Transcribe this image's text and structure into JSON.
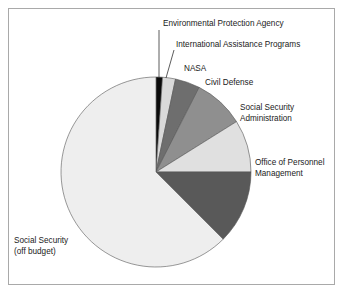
{
  "figure": {
    "background_color": "#ffffff",
    "border_color": "#a9a9a9"
  },
  "chart_data": {
    "type": "pie",
    "title": "",
    "subtitle": "",
    "xlabel": "",
    "ylabel": "",
    "legend_position": "callout-labels",
    "grid": false,
    "start_angle_deg": 90,
    "direction": "clockwise",
    "categories": [
      "Environmental Protection Agency",
      "International Assistance Programs",
      "NASA",
      "Civil Defense",
      "Social Security Administration",
      "Office of Personnel Management",
      "Social Security (off budget)"
    ],
    "values": [
      1.1,
      2.2,
      4.2,
      8.6,
      8.9,
      12.5,
      62.5
    ],
    "units": "percent",
    "colors": [
      "#0a0a0a",
      "#d9d9d9",
      "#6e6e6e",
      "#8f8f8f",
      "#e0e0e0",
      "#595959",
      "#eeeeee"
    ],
    "slice_angles_deg": [
      4,
      8,
      15,
      31,
      32,
      45,
      225
    ]
  },
  "labels": {
    "epa": "Environmental Protection Agency",
    "iap": "International Assistance Programs",
    "nasa": "NASA",
    "civil_defense": "Civil Defense",
    "ssa_line1": "Social Security",
    "ssa_line2": "Administration",
    "opm_line1": "Office of Personnel",
    "opm_line2": "Management",
    "ss_offbudget_line1": "Social Security",
    "ss_offbudget_line2": "(off budget)"
  }
}
